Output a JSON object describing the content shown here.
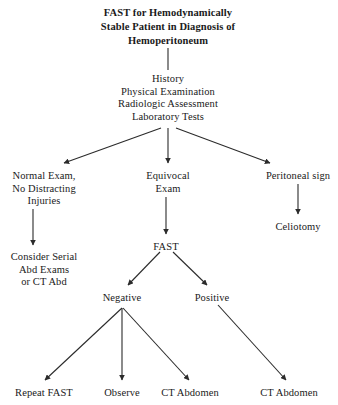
{
  "diagram": {
    "type": "clinical-algorithm-flowchart",
    "title": {
      "lines": [
        "FAST for Hemodynamically",
        "Stable Patient in Diagnosis of",
        "Hemoperitoneum"
      ]
    },
    "colors": {
      "background": "#ffffff",
      "text": "#1a1a1a",
      "edge": "#2b2b2b"
    },
    "nodes": [
      {
        "id": "workup",
        "lines": [
          "History",
          "Physical Examination",
          "Radiologic Assessment",
          "Laboratory Tests"
        ],
        "x": 168,
        "y": 73
      },
      {
        "id": "normal-exam",
        "lines": [
          "Normal Exam,",
          "No Distracting",
          "Injuries"
        ],
        "x": 44,
        "y": 170
      },
      {
        "id": "equivocal-exam",
        "lines": [
          "Equivocal",
          "Exam"
        ],
        "x": 168,
        "y": 170
      },
      {
        "id": "peritoneal-sign",
        "lines": [
          "Peritoneal sign"
        ],
        "x": 298,
        "y": 170
      },
      {
        "id": "celiotomy",
        "lines": [
          "Celiotomy"
        ],
        "x": 298,
        "y": 221
      },
      {
        "id": "consider-serial",
        "lines": [
          "Consider Serial",
          "Abd Exams",
          "or CT Abd"
        ],
        "x": 44,
        "y": 251
      },
      {
        "id": "fast",
        "lines": [
          "FAST"
        ],
        "x": 166,
        "y": 241
      },
      {
        "id": "negative",
        "lines": [
          "Negative"
        ],
        "x": 122,
        "y": 292
      },
      {
        "id": "positive",
        "lines": [
          "Positive"
        ],
        "x": 212,
        "y": 292
      },
      {
        "id": "repeat-fast",
        "lines": [
          "Repeat FAST"
        ],
        "x": 44,
        "y": 387
      },
      {
        "id": "observe",
        "lines": [
          "Observe"
        ],
        "x": 122,
        "y": 387
      },
      {
        "id": "ct-abdomen-negative",
        "lines": [
          "CT Abdomen"
        ],
        "x": 190,
        "y": 387
      },
      {
        "id": "ct-abdomen-positive",
        "lines": [
          "CT Abdomen"
        ],
        "x": 289,
        "y": 387
      }
    ],
    "edges": [
      {
        "id": "title-to-workup",
        "from": "title",
        "to": "workup",
        "arrowhead": false,
        "x1": 168,
        "y1": 48,
        "x2": 168,
        "y2": 70
      },
      {
        "id": "workup-to-normal-exam",
        "from": "workup",
        "to": "normal-exam",
        "arrowhead": true,
        "x1": 161,
        "y1": 128,
        "x2": 64,
        "y2": 163
      },
      {
        "id": "workup-to-equivocal-exam",
        "from": "workup",
        "to": "equivocal-exam",
        "arrowhead": true,
        "x1": 168,
        "y1": 128,
        "x2": 168,
        "y2": 163
      },
      {
        "id": "workup-to-peritoneal-sign",
        "from": "workup",
        "to": "peritoneal-sign",
        "arrowhead": true,
        "x1": 176,
        "y1": 128,
        "x2": 270,
        "y2": 163
      },
      {
        "id": "peritoneal-sign-to-celiotomy",
        "from": "peritoneal-sign",
        "to": "celiotomy",
        "arrowhead": true,
        "x1": 298,
        "y1": 184,
        "x2": 298,
        "y2": 214
      },
      {
        "id": "normal-exam-to-consider-serial",
        "from": "normal-exam",
        "to": "consider-serial",
        "arrowhead": true,
        "x1": 33,
        "y1": 209,
        "x2": 33,
        "y2": 245
      },
      {
        "id": "equivocal-exam-to-fast",
        "from": "equivocal-exam",
        "to": "fast",
        "arrowhead": true,
        "x1": 166,
        "y1": 197,
        "x2": 166,
        "y2": 234
      },
      {
        "id": "fast-to-negative",
        "from": "fast",
        "to": "negative",
        "arrowhead": true,
        "x1": 160,
        "y1": 252,
        "x2": 128,
        "y2": 285
      },
      {
        "id": "fast-to-positive",
        "from": "fast",
        "to": "positive",
        "arrowhead": true,
        "x1": 173,
        "y1": 252,
        "x2": 207,
        "y2": 285
      },
      {
        "id": "negative-to-repeat-fast",
        "from": "negative",
        "to": "repeat-fast",
        "arrowhead": true,
        "x1": 122,
        "y1": 308,
        "x2": 45,
        "y2": 380
      },
      {
        "id": "negative-to-observe",
        "from": "negative",
        "to": "observe",
        "arrowhead": true,
        "x1": 122,
        "y1": 308,
        "x2": 122,
        "y2": 380
      },
      {
        "id": "negative-to-ct-abdomen",
        "from": "negative",
        "to": "ct-abdomen-negative",
        "arrowhead": true,
        "x1": 123,
        "y1": 308,
        "x2": 189,
        "y2": 380
      },
      {
        "id": "positive-to-ct-abdomen",
        "from": "positive",
        "to": "ct-abdomen-positive",
        "arrowhead": true,
        "x1": 218,
        "y1": 305,
        "x2": 286,
        "y2": 380
      }
    ]
  }
}
